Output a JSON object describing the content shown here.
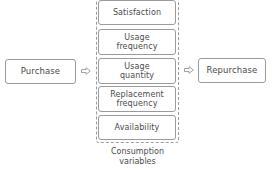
{
  "diagram": {
    "start": {
      "label": "Purchase"
    },
    "end": {
      "label": "Repurchase"
    },
    "group": {
      "caption_line1": "Consumption",
      "caption_line2": "variables",
      "items": [
        {
          "line1": "Satisfaction",
          "line2": ""
        },
        {
          "line1": "Usage",
          "line2": "frequency"
        },
        {
          "line1": "Usage",
          "line2": "quantity"
        },
        {
          "line1": "Replacement",
          "line2": "frequency"
        },
        {
          "line1": "Availability",
          "line2": ""
        }
      ]
    },
    "arrows": [
      {
        "from": "Purchase",
        "to": "Consumption variables",
        "icon": "hollow-right-arrow-icon"
      },
      {
        "from": "Consumption variables",
        "to": "Repurchase",
        "icon": "hollow-right-arrow-icon"
      }
    ],
    "colors": {
      "border": "#9a9a9a",
      "text": "#4a4a4a",
      "background": "#ffffff"
    }
  }
}
